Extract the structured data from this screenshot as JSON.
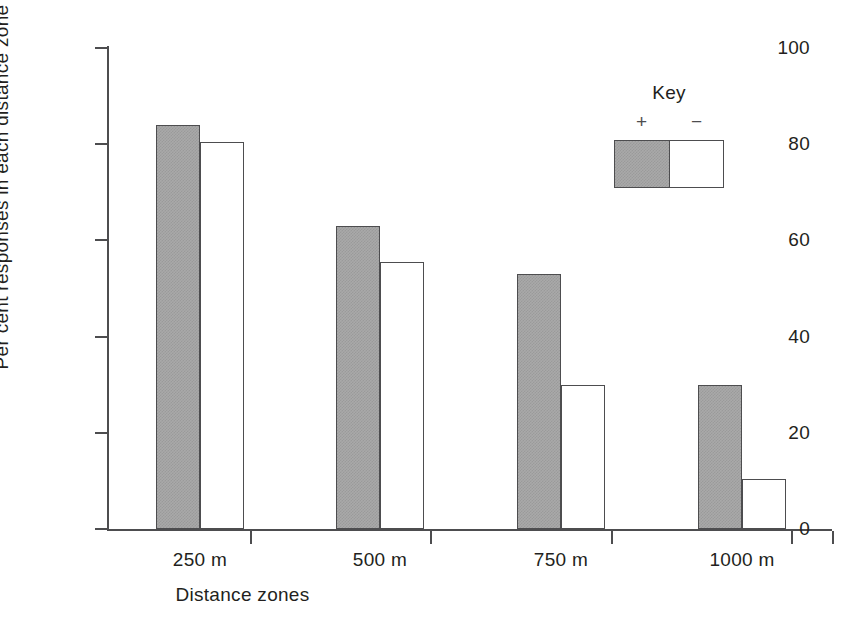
{
  "chart_data": {
    "type": "bar",
    "title": "",
    "xlabel": "Distance zones",
    "ylabel": "Per cent responses in each distance zone",
    "categories": [
      "250 m",
      "500 m",
      "750 m",
      "1000 m"
    ],
    "series": [
      {
        "name": "+",
        "fill": "gray",
        "values": [
          84,
          63,
          53,
          30
        ]
      },
      {
        "name": "−",
        "fill": "white",
        "values": [
          80.5,
          55.5,
          30,
          10.5
        ]
      }
    ],
    "ylim": [
      0,
      100
    ],
    "yticks": [
      0,
      20,
      40,
      60,
      80,
      100
    ],
    "ytick_labels": [
      "0",
      "20",
      "40",
      "60",
      "80",
      "100"
    ],
    "grid": false,
    "legend_position": "upper right",
    "legend": {
      "title": "Key",
      "entries": [
        {
          "symbol": "+",
          "fill": "gray"
        },
        {
          "symbol": "−",
          "fill": "white"
        }
      ]
    }
  },
  "colors": {
    "axis": "#4d4d4f",
    "text": "#231f20",
    "bar_plus_fill": "#a9a9a9",
    "bar_minus_fill": "#ffffff",
    "background": "#ffffff"
  }
}
